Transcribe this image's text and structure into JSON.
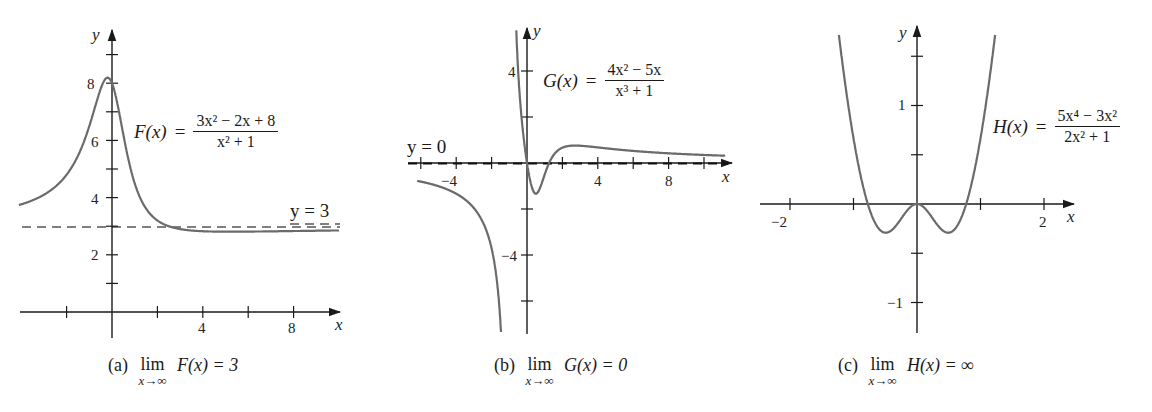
{
  "figures": [
    {
      "id": "a",
      "function_label": "F(x)",
      "numerator": "3x² − 2x + 8",
      "denominator": "x² + 1",
      "asymptote_label": "y = 3",
      "caption": {
        "tag": "(a)",
        "lim": "lim",
        "sub": "x→∞",
        "expr": "F(x) = 3"
      },
      "axis_labels": {
        "x": "x",
        "y": "y"
      },
      "x_tick_labels": [
        "4",
        "8"
      ],
      "y_tick_labels": [
        "2",
        "4",
        "6",
        "8"
      ]
    },
    {
      "id": "b",
      "function_label": "G(x)",
      "numerator": "4x² − 5x",
      "denominator": "x³ + 1",
      "asymptote_label": "y = 0",
      "caption": {
        "tag": "(b)",
        "lim": "lim",
        "sub": "x→∞",
        "expr": "G(x) = 0"
      },
      "axis_labels": {
        "x": "x",
        "y": "y"
      },
      "x_tick_labels": [
        "−4",
        "4",
        "8"
      ],
      "y_tick_labels": [
        "4",
        "−4"
      ]
    },
    {
      "id": "c",
      "function_label": "H(x)",
      "numerator": "5x⁴ − 3x²",
      "denominator": "2x² + 1",
      "asymptote_label": "",
      "caption": {
        "tag": "(c)",
        "lim": "lim",
        "sub": "x→∞",
        "expr": "H(x) = ∞"
      },
      "axis_labels": {
        "x": "x",
        "y": "y"
      },
      "x_tick_labels": [
        "−2",
        "2"
      ],
      "y_tick_labels": [
        "1",
        "−1"
      ]
    }
  ],
  "colors": {
    "curve": "#6b6b6b",
    "axis": "#1a1a1a",
    "asymptote": "#555555"
  },
  "chart_data": [
    {
      "type": "line",
      "title": "(a) lim x→∞ F(x) = 3",
      "series": [
        {
          "name": "F(x) = (3x² − 2x + 8)/(x² + 1)",
          "expr": "(3*x*x-2*x+8)/(x*x+1)"
        }
      ],
      "asymptote": {
        "y": 3,
        "label": "y = 3",
        "style": "dashed"
      },
      "xlabel": "x",
      "ylabel": "y",
      "xlim": [
        -4.2,
        10
      ],
      "ylim": [
        -0.8,
        9.4
      ],
      "x_ticks": [
        -2,
        0,
        2,
        4,
        6,
        8
      ],
      "x_tick_labels": {
        "4": "4",
        "8": "8"
      },
      "y_ticks": [
        1,
        2,
        3,
        4,
        5,
        6,
        7,
        8,
        9
      ],
      "y_tick_labels": {
        "2": "2",
        "4": "4",
        "6": "6",
        "8": "8"
      },
      "sample_points": {
        "x": [
          -4,
          -2,
          -1,
          -0.3,
          0,
          1,
          2,
          3,
          4,
          8,
          10
        ],
        "y": [
          3.59,
          4.4,
          6.5,
          8.16,
          8,
          4.5,
          3.0,
          2.9,
          2.94,
          2.95,
          2.96
        ]
      },
      "grid": false
    },
    {
      "type": "line",
      "title": "(b) lim x→∞ G(x) = 0",
      "series": [
        {
          "name": "G(x) = (4x² − 5x)/(x³ + 1)",
          "expr": "(4*x*x-5*x)/(x*x*x+1)"
        }
      ],
      "asymptote": {
        "y": 0,
        "label": "y = 0",
        "style": "dashed"
      },
      "vertical_asymptote_x": -1,
      "xlabel": "x",
      "ylabel": "y",
      "xlim": [
        -6.2,
        11.2
      ],
      "ylim": [
        -7.4,
        5.4
      ],
      "x_ticks": [
        -6,
        -4,
        -2,
        0,
        2,
        4,
        6,
        8,
        10
      ],
      "x_tick_labels": {
        "-4": "−4",
        "4": "4",
        "8": "8"
      },
      "y_ticks": [
        -6,
        -4,
        -2,
        2,
        4
      ],
      "y_tick_labels": {
        "4": "4",
        "-4": "−4"
      },
      "sample_points": {
        "x": [
          -6,
          -4,
          -2,
          -1.2,
          0,
          0.6,
          1.25,
          2,
          4,
          8,
          11
        ],
        "y": [
          -0.8,
          -1.33,
          -3.71,
          -9.5,
          0,
          -0.85,
          0,
          0.67,
          0.68,
          0.42,
          0.32
        ]
      },
      "grid": false
    },
    {
      "type": "line",
      "title": "(c) lim x→∞ H(x) = ∞",
      "series": [
        {
          "name": "H(x) = (5x⁴ − 3x²)/(2x² + 1)",
          "expr": "(5*x**4-3*x*x)/(2*x*x+1)"
        }
      ],
      "xlabel": "x",
      "ylabel": "y",
      "xlim": [
        -2.45,
        2.35
      ],
      "ylim": [
        -1.3,
        1.6
      ],
      "x_ticks": [
        -2,
        -1,
        1,
        2
      ],
      "x_tick_labels": {
        "-2": "−2",
        "2": "2"
      },
      "y_ticks": [
        -1,
        -0.5,
        0.5,
        1,
        1.5
      ],
      "y_tick_labels": {
        "1": "1",
        "-1": "−1"
      },
      "sample_points": {
        "x": [
          -1.2,
          -0.8,
          -0.5,
          0,
          0.5,
          0.8,
          1.2
        ],
        "y": [
          1.65,
          0.1,
          -0.21,
          0,
          -0.21,
          0.1,
          1.65
        ]
      },
      "grid": false
    }
  ]
}
